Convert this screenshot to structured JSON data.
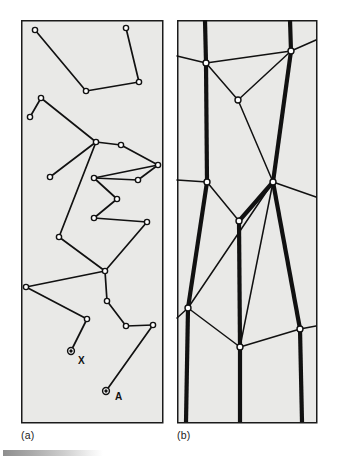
{
  "figure": {
    "caption_a": "(a)",
    "caption_b": "(b)",
    "panel_fill": "#e9e9e7",
    "panel_border": "#1b1b1b",
    "line_color": "#111111",
    "node_fill": "#ffffff",
    "gradient_bar": {
      "from": "#8e8e8e",
      "to": "#ffffff"
    }
  },
  "panel_a": {
    "name": "polyline-network-panel",
    "frame": {
      "x": 21,
      "y": 20,
      "width": 141,
      "height": 402
    },
    "labels": [
      {
        "text": "X",
        "x": 78,
        "y": 364
      },
      {
        "text": "A",
        "x": 115,
        "y": 400
      }
    ],
    "marked_points": [
      {
        "name": "point-x",
        "x": 71,
        "y": 351
      },
      {
        "name": "point-a",
        "x": 106,
        "y": 391
      }
    ],
    "nodes": [
      {
        "x": 35,
        "y": 30
      },
      {
        "x": 126,
        "y": 28
      },
      {
        "x": 86,
        "y": 91
      },
      {
        "x": 139,
        "y": 82
      },
      {
        "x": 41,
        "y": 98
      },
      {
        "x": 30,
        "y": 117
      },
      {
        "x": 96,
        "y": 142
      },
      {
        "x": 121,
        "y": 145
      },
      {
        "x": 50,
        "y": 177
      },
      {
        "x": 158,
        "y": 165
      },
      {
        "x": 94,
        "y": 178
      },
      {
        "x": 138,
        "y": 180
      },
      {
        "x": 117,
        "y": 199
      },
      {
        "x": 94,
        "y": 218
      },
      {
        "x": 147,
        "y": 222
      },
      {
        "x": 59,
        "y": 237
      },
      {
        "x": 105,
        "y": 271
      },
      {
        "x": 26,
        "y": 287
      },
      {
        "x": 107,
        "y": 301
      },
      {
        "x": 87,
        "y": 319
      },
      {
        "x": 126,
        "y": 326
      },
      {
        "x": 153,
        "y": 325
      }
    ],
    "edges": [
      [
        0,
        2
      ],
      [
        2,
        3
      ],
      [
        3,
        1
      ],
      [
        5,
        4
      ],
      [
        4,
        6
      ],
      [
        6,
        7
      ],
      [
        7,
        9
      ],
      [
        9,
        10
      ],
      [
        10,
        11
      ],
      [
        11,
        9
      ],
      [
        6,
        8
      ],
      [
        10,
        12
      ],
      [
        12,
        13
      ],
      [
        13,
        14
      ],
      [
        14,
        16
      ],
      [
        16,
        15
      ],
      [
        15,
        6
      ],
      [
        16,
        17
      ],
      [
        17,
        19
      ],
      [
        16,
        18
      ],
      [
        18,
        20
      ],
      [
        20,
        21
      ],
      [
        19,
        22
      ],
      [
        21,
        23
      ]
    ]
  },
  "panel_b": {
    "name": "thick-line-network-panel",
    "frame": {
      "x": 177,
      "y": 20,
      "width": 139,
      "height": 402
    },
    "nodes": [
      {
        "x": 206,
        "y": 63
      },
      {
        "x": 291,
        "y": 51
      },
      {
        "x": 238,
        "y": 100
      },
      {
        "x": 207,
        "y": 182
      },
      {
        "x": 273,
        "y": 182
      },
      {
        "x": 239,
        "y": 221
      },
      {
        "x": 188,
        "y": 308
      },
      {
        "x": 240,
        "y": 347
      },
      {
        "x": 300,
        "y": 329
      }
    ],
    "thick_edges": [
      {
        "from": {
          "x": 205,
          "y": 20
        },
        "to": {
          "x": 206,
          "y": 63
        }
      },
      {
        "from": {
          "x": 290,
          "y": 20
        },
        "to": {
          "x": 291,
          "y": 51
        }
      },
      {
        "from": {
          "x": 206,
          "y": 63
        },
        "to": {
          "x": 207,
          "y": 182
        }
      },
      {
        "from": {
          "x": 291,
          "y": 51
        },
        "to": {
          "x": 273,
          "y": 182
        }
      },
      {
        "from": {
          "x": 207,
          "y": 182
        },
        "to": {
          "x": 188,
          "y": 308
        }
      },
      {
        "from": {
          "x": 273,
          "y": 182
        },
        "to": {
          "x": 239,
          "y": 221
        }
      },
      {
        "from": {
          "x": 239,
          "y": 221
        },
        "to": {
          "x": 240,
          "y": 347
        }
      },
      {
        "from": {
          "x": 273,
          "y": 182
        },
        "to": {
          "x": 300,
          "y": 329
        }
      },
      {
        "from": {
          "x": 188,
          "y": 308
        },
        "to": {
          "x": 186,
          "y": 422
        }
      },
      {
        "from": {
          "x": 240,
          "y": 347
        },
        "to": {
          "x": 240,
          "y": 422
        }
      },
      {
        "from": {
          "x": 300,
          "y": 329
        },
        "to": {
          "x": 302,
          "y": 422
        }
      }
    ],
    "thin_edges": [
      {
        "from": {
          "x": 177,
          "y": 56
        },
        "to": {
          "x": 206,
          "y": 63
        }
      },
      {
        "from": {
          "x": 206,
          "y": 63
        },
        "to": {
          "x": 291,
          "y": 51
        }
      },
      {
        "from": {
          "x": 291,
          "y": 51
        },
        "to": {
          "x": 316,
          "y": 40
        }
      },
      {
        "from": {
          "x": 206,
          "y": 63
        },
        "to": {
          "x": 238,
          "y": 100
        }
      },
      {
        "from": {
          "x": 238,
          "y": 100
        },
        "to": {
          "x": 291,
          "y": 51
        }
      },
      {
        "from": {
          "x": 238,
          "y": 100
        },
        "to": {
          "x": 273,
          "y": 182
        }
      },
      {
        "from": {
          "x": 177,
          "y": 180
        },
        "to": {
          "x": 207,
          "y": 182
        }
      },
      {
        "from": {
          "x": 207,
          "y": 182
        },
        "to": {
          "x": 239,
          "y": 221
        }
      },
      {
        "from": {
          "x": 273,
          "y": 182
        },
        "to": {
          "x": 316,
          "y": 197
        }
      },
      {
        "from": {
          "x": 273,
          "y": 182
        },
        "to": {
          "x": 188,
          "y": 308
        }
      },
      {
        "from": {
          "x": 273,
          "y": 182
        },
        "to": {
          "x": 240,
          "y": 347
        }
      },
      {
        "from": {
          "x": 188,
          "y": 308
        },
        "to": {
          "x": 177,
          "y": 318
        }
      },
      {
        "from": {
          "x": 188,
          "y": 308
        },
        "to": {
          "x": 240,
          "y": 347
        }
      },
      {
        "from": {
          "x": 240,
          "y": 347
        },
        "to": {
          "x": 300,
          "y": 329
        }
      },
      {
        "from": {
          "x": 300,
          "y": 329
        },
        "to": {
          "x": 316,
          "y": 326
        }
      }
    ]
  }
}
